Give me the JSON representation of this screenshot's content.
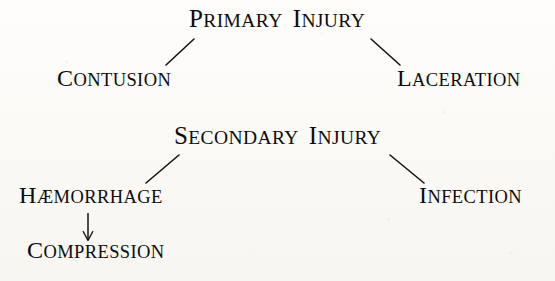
{
  "figure": {
    "background_color": "#fcfbf9",
    "ink_color": "#0d0c0c"
  },
  "nodes": {
    "primary_injury": {
      "initial": "P",
      "rest": "RIMARY",
      "initial2": "I",
      "rest2": "NJURY",
      "full_text": "PRIMARY INJURY"
    },
    "contusion": {
      "initial": "C",
      "rest": "ONTUSION",
      "full_text": "CONTUSION"
    },
    "laceration": {
      "initial": "L",
      "rest": "ACERATION",
      "full_text": "LACERATION"
    },
    "secondary_injury": {
      "initial": "S",
      "rest": "ECONDARY",
      "initial2": "I",
      "rest2": "NJURY",
      "full_text": "SECONDARY INJURY"
    },
    "haemorrhage": {
      "initial": "H",
      "rest": "ÆMORRHAGE",
      "full_text": "HÆMORRHAGE"
    },
    "infection": {
      "initial": "I",
      "rest": "NFECTION",
      "full_text": "INFECTION"
    },
    "compression": {
      "initial": "C",
      "rest": "OMPRESSION",
      "full_text": "COMPRESSION"
    }
  },
  "connectors": [
    {
      "name": "primary-to-contusion",
      "from": "primary_injury",
      "to": "contusion",
      "style": "line",
      "x1": 194,
      "y1": 39,
      "x2": 166,
      "y2": 65
    },
    {
      "name": "primary-to-laceration",
      "from": "primary_injury",
      "to": "laceration",
      "style": "line",
      "x1": 371,
      "y1": 39,
      "x2": 400,
      "y2": 65
    },
    {
      "name": "secondary-to-haemorrhage",
      "from": "secondary_injury",
      "to": "haemorrhage",
      "style": "line",
      "x1": 179,
      "y1": 155,
      "x2": 146,
      "y2": 183
    },
    {
      "name": "secondary-to-infection",
      "from": "secondary_injury",
      "to": "infection",
      "style": "line",
      "x1": 390,
      "y1": 155,
      "x2": 424,
      "y2": 183
    },
    {
      "name": "haemorrhage-to-compression",
      "from": "haemorrhage",
      "to": "compression",
      "style": "arrow",
      "x1": 88,
      "y1": 213,
      "x2": 88,
      "y2": 240
    }
  ]
}
